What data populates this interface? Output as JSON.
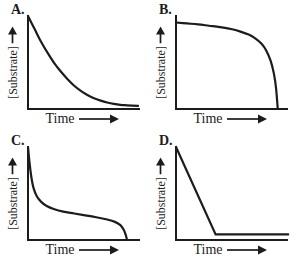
{
  "figure": {
    "name": "substrate-vs-time-four-panel-figure"
  },
  "colors": {
    "line": "#1c1c1c",
    "background": "#ffffff"
  },
  "panels": [
    {
      "label": "A.",
      "y_axis_label": "[Substrate]",
      "x_axis_label": "Time"
    },
    {
      "label": "B.",
      "y_axis_label": "[Substrate]",
      "x_axis_label": "Time"
    },
    {
      "label": "C.",
      "y_axis_label": "[Substrate]",
      "x_axis_label": "Time"
    },
    {
      "label": "D.",
      "y_axis_label": "[Substrate]",
      "x_axis_label": "Time"
    }
  ],
  "chart_data": [
    {
      "type": "line",
      "title": "A.",
      "xlabel": "Time",
      "ylabel": "[Substrate]",
      "xlim": [
        0,
        100
      ],
      "ylim": [
        0,
        100
      ],
      "grid": false,
      "legend": "none",
      "smooth": true,
      "points": [
        [
          0,
          100
        ],
        [
          6,
          86
        ],
        [
          12,
          72
        ],
        [
          18,
          60
        ],
        [
          24,
          49
        ],
        [
          30,
          40
        ],
        [
          36,
          32
        ],
        [
          42,
          25
        ],
        [
          48,
          19.5
        ],
        [
          54,
          15
        ],
        [
          60,
          11.5
        ],
        [
          66,
          9
        ],
        [
          72,
          7
        ],
        [
          78,
          5.5
        ],
        [
          84,
          4.5
        ],
        [
          90,
          4
        ],
        [
          100,
          3.3
        ]
      ]
    },
    {
      "type": "line",
      "title": "B.",
      "xlabel": "Time",
      "ylabel": "[Substrate]",
      "xlim": [
        0,
        100
      ],
      "ylim": [
        0,
        100
      ],
      "grid": false,
      "legend": "none",
      "smooth": true,
      "points": [
        [
          0,
          93
        ],
        [
          10,
          92
        ],
        [
          20,
          91
        ],
        [
          30,
          89.5
        ],
        [
          40,
          88
        ],
        [
          50,
          86
        ],
        [
          58,
          83.5
        ],
        [
          66,
          80
        ],
        [
          72,
          76
        ],
        [
          78,
          70
        ],
        [
          82,
          63
        ],
        [
          86,
          52
        ],
        [
          89,
          38
        ],
        [
          91,
          22
        ],
        [
          92.5,
          0
        ]
      ]
    },
    {
      "type": "line",
      "title": "C.",
      "xlabel": "Time",
      "ylabel": "[Substrate]",
      "xlim": [
        0,
        100
      ],
      "ylim": [
        0,
        100
      ],
      "grid": false,
      "legend": "none",
      "smooth": true,
      "points": [
        [
          0,
          100
        ],
        [
          1.5,
          82
        ],
        [
          3,
          68
        ],
        [
          5,
          56
        ],
        [
          8,
          47
        ],
        [
          12,
          41
        ],
        [
          17,
          36.5
        ],
        [
          24,
          33
        ],
        [
          32,
          30.5
        ],
        [
          42,
          28.5
        ],
        [
          52,
          26.5
        ],
        [
          62,
          24.5
        ],
        [
          72,
          22
        ],
        [
          79,
          19.5
        ],
        [
          84,
          16
        ],
        [
          87,
          11
        ],
        [
          89,
          5
        ],
        [
          90,
          0
        ]
      ]
    },
    {
      "type": "line",
      "title": "D.",
      "xlabel": "Time",
      "ylabel": "[Substrate]",
      "xlim": [
        0,
        100
      ],
      "ylim": [
        0,
        100
      ],
      "grid": false,
      "legend": "none",
      "smooth": false,
      "points": [
        [
          0,
          100
        ],
        [
          36,
          6
        ],
        [
          102,
          6
        ]
      ]
    }
  ]
}
